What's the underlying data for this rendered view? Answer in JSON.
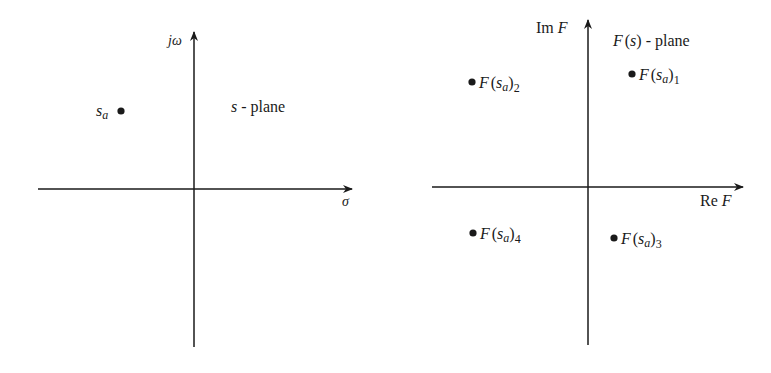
{
  "colors": {
    "ink": "#1a1a1a",
    "background": "#ffffff"
  },
  "left_plane": {
    "name": "s-plane",
    "plane_label": "s-plane",
    "plane_label_var": "s",
    "plane_label_rest": " - plane",
    "vertical_axis_label": "jω",
    "horizontal_axis_label": "σ",
    "point": {
      "label_main": "s",
      "label_sub": "a"
    }
  },
  "right_plane": {
    "name": "F(s)-plane",
    "plane_label_var": "F",
    "plane_label_paren_open": "(",
    "plane_label_arg": "s",
    "plane_label_paren_close": ")",
    "plane_label_rest": " - plane",
    "vertical_axis_label_prefix": "Im ",
    "vertical_axis_label_var": "F",
    "horizontal_axis_label_prefix": "Re ",
    "horizontal_axis_label_var": "F",
    "points": [
      {
        "func": "F",
        "arg": "s",
        "arg_sub": "a",
        "index": "1"
      },
      {
        "func": "F",
        "arg": "s",
        "arg_sub": "a",
        "index": "2"
      },
      {
        "func": "F",
        "arg": "s",
        "arg_sub": "a",
        "index": "3"
      },
      {
        "func": "F",
        "arg": "s",
        "arg_sub": "a",
        "index": "4"
      }
    ]
  }
}
